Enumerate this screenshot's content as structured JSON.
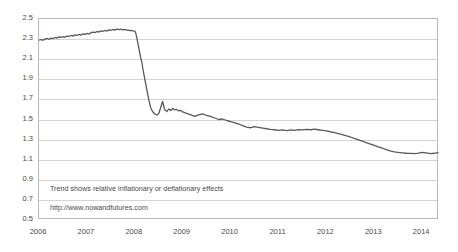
{
  "chart_data": {
    "type": "line",
    "title": "",
    "subtitle": "",
    "xlabel": "",
    "ylabel": "",
    "grid": true,
    "legend_position": "none",
    "xlim": [
      2006.0,
      2014.35
    ],
    "ylim": [
      0.5,
      2.5
    ],
    "ytick_step": 0.2,
    "yticks": [
      "2.5",
      "2.3",
      "2.1",
      "1.9",
      "1.7",
      "1.5",
      "1.3",
      "1.1",
      "0.9",
      "0.7",
      "0.5"
    ],
    "xticks": [
      "2006",
      "2007",
      "2008",
      "2009",
      "2010",
      "2011",
      "2012",
      "2013",
      "2014"
    ],
    "line_color": "#595959",
    "gridline_color": "#d4d4d4",
    "frame_color": "#b9b9b9",
    "series": [
      {
        "name": "trend",
        "x": [
          2006.0,
          2006.04,
          2006.08,
          2006.12,
          2006.17,
          2006.21,
          2006.25,
          2006.29,
          2006.33,
          2006.37,
          2006.42,
          2006.46,
          2006.5,
          2006.54,
          2006.58,
          2006.62,
          2006.67,
          2006.71,
          2006.75,
          2006.79,
          2006.83,
          2006.87,
          2006.92,
          2006.96,
          2007.0,
          2007.04,
          2007.08,
          2007.12,
          2007.17,
          2007.21,
          2007.25,
          2007.29,
          2007.33,
          2007.37,
          2007.42,
          2007.46,
          2007.5,
          2007.54,
          2007.58,
          2007.62,
          2007.67,
          2007.71,
          2007.75,
          2007.79,
          2007.83,
          2007.87,
          2007.9,
          2007.93,
          2007.96,
          2008.0,
          2008.02,
          2008.04,
          2008.06,
          2008.08,
          2008.1,
          2008.12,
          2008.15,
          2008.17,
          2008.19,
          2008.21,
          2008.23,
          2008.25,
          2008.27,
          2008.29,
          2008.31,
          2008.33,
          2008.37,
          2008.42,
          2008.46,
          2008.5,
          2008.54,
          2008.58,
          2008.62,
          2008.67,
          2008.71,
          2008.75,
          2008.79,
          2008.83,
          2008.87,
          2008.92,
          2008.96,
          2009.0,
          2009.08,
          2009.17,
          2009.25,
          2009.33,
          2009.42,
          2009.5,
          2009.58,
          2009.67,
          2009.75,
          2009.83,
          2009.92,
          2010.0,
          2010.08,
          2010.17,
          2010.25,
          2010.33,
          2010.42,
          2010.5,
          2010.58,
          2010.67,
          2010.75,
          2010.83,
          2010.92,
          2011.0,
          2011.08,
          2011.17,
          2011.25,
          2011.33,
          2011.42,
          2011.5,
          2011.58,
          2011.67,
          2011.75,
          2011.83,
          2011.92,
          2012.0,
          2012.08,
          2012.17,
          2012.25,
          2012.33,
          2012.42,
          2012.5,
          2012.58,
          2012.67,
          2012.75,
          2012.83,
          2012.92,
          2013.0,
          2013.08,
          2013.17,
          2013.25,
          2013.33,
          2013.42,
          2013.5,
          2013.58,
          2013.67,
          2013.75,
          2013.83,
          2013.92,
          2014.0,
          2014.08,
          2014.17,
          2014.25,
          2014.33
        ],
        "y": [
          2.29,
          2.296,
          2.288,
          2.3,
          2.306,
          2.298,
          2.31,
          2.304,
          2.316,
          2.31,
          2.322,
          2.316,
          2.324,
          2.318,
          2.33,
          2.326,
          2.336,
          2.33,
          2.342,
          2.336,
          2.346,
          2.34,
          2.352,
          2.348,
          2.356,
          2.35,
          2.362,
          2.37,
          2.364,
          2.376,
          2.37,
          2.382,
          2.376,
          2.386,
          2.38,
          2.392,
          2.386,
          2.396,
          2.39,
          2.4,
          2.394,
          2.398,
          2.392,
          2.396,
          2.39,
          2.388,
          2.384,
          2.386,
          2.382,
          2.38,
          2.36,
          2.32,
          2.27,
          2.22,
          2.17,
          2.12,
          2.06,
          2.0,
          1.95,
          1.9,
          1.85,
          1.8,
          1.75,
          1.7,
          1.66,
          1.62,
          1.58,
          1.555,
          1.545,
          1.56,
          1.62,
          1.68,
          1.6,
          1.58,
          1.605,
          1.59,
          1.61,
          1.595,
          1.6,
          1.585,
          1.59,
          1.575,
          1.56,
          1.545,
          1.53,
          1.545,
          1.555,
          1.54,
          1.53,
          1.515,
          1.5,
          1.505,
          1.49,
          1.48,
          1.47,
          1.455,
          1.44,
          1.425,
          1.418,
          1.43,
          1.422,
          1.415,
          1.408,
          1.402,
          1.398,
          1.392,
          1.396,
          1.39,
          1.396,
          1.392,
          1.4,
          1.396,
          1.402,
          1.398,
          1.404,
          1.398,
          1.392,
          1.386,
          1.378,
          1.37,
          1.36,
          1.35,
          1.338,
          1.326,
          1.312,
          1.298,
          1.284,
          1.27,
          1.256,
          1.242,
          1.228,
          1.214,
          1.2,
          1.188,
          1.178,
          1.172,
          1.168,
          1.164,
          1.162,
          1.16,
          1.165,
          1.172,
          1.168,
          1.16,
          1.164,
          1.17
        ]
      }
    ],
    "annotations": [
      {
        "id": "trend-note",
        "text": "Trend shows relative inflationary or deflationary effects"
      },
      {
        "id": "source-url",
        "text": "http://www.nowandfutures.com"
      }
    ]
  }
}
